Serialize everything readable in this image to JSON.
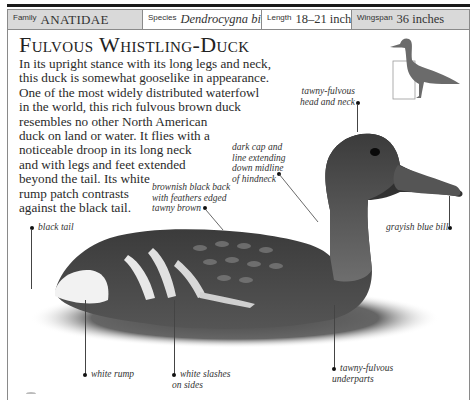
{
  "header": {
    "family": {
      "label": "Family",
      "value": "ANATIDAE"
    },
    "species": {
      "label": "Species",
      "value": "Dendrocygna bicolor"
    },
    "length": {
      "label": "Length",
      "value": "18–21 inches"
    },
    "wingspan": {
      "label": "Wingspan",
      "value": "36 inches"
    }
  },
  "title": "Fulvous Whistling-Duck",
  "description": {
    "lines": [
      "In its upright stance with its long legs and neck,",
      "this duck is somewhat gooselike in appearance.",
      "One of the most widely distributed waterfowl",
      "in the world, this rich fulvous brown duck",
      "resembles no other North American",
      "duck on land or water. It flies with a",
      "noticeable droop in its long neck",
      "and with legs and feet extended",
      "beyond the tail. Its white",
      "rump patch contrasts",
      "against the black tail."
    ]
  },
  "silhouette": {
    "icon": "standing-duck-silhouette-icon",
    "color": "#6b6b6b"
  },
  "callouts": {
    "head_neck": [
      "tawny-fulvous",
      "head and neck"
    ],
    "dark_cap": [
      "dark cap and",
      "line extending",
      "down midline",
      "of hindneck"
    ],
    "back": [
      "brownish black back",
      "with feathers edged",
      "tawny brown"
    ],
    "black_tail": [
      "black tail"
    ],
    "bill": [
      "grayish blue bill"
    ],
    "white_rump": [
      "white rump"
    ],
    "white_slashes": [
      "white slashes",
      "on sides"
    ],
    "underparts": [
      "tawny-fulvous",
      "underparts"
    ]
  },
  "colors": {
    "rule": "#1a1a1a",
    "header_shade": "#d9d9d9",
    "frame": "#8a8a8a",
    "text": "#222222"
  }
}
